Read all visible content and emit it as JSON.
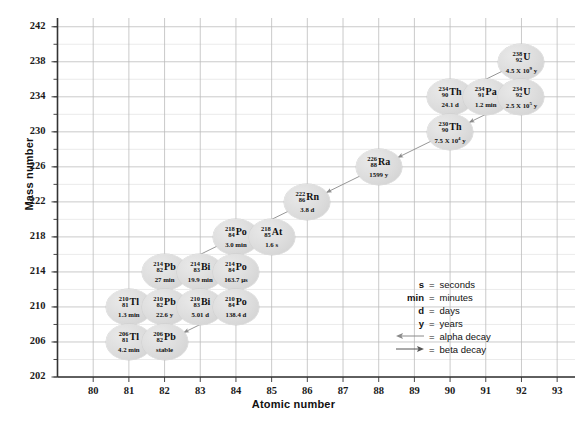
{
  "chart_data": {
    "type": "scatter",
    "title": "",
    "xlabel": "Atomic number",
    "ylabel": "Mass number",
    "xlim": [
      79,
      93.5
    ],
    "ylim": [
      202,
      243
    ],
    "xticks": [
      80,
      81,
      82,
      83,
      84,
      85,
      86,
      87,
      88,
      89,
      90,
      91,
      92,
      93
    ],
    "yticks": [
      202,
      206,
      210,
      214,
      218,
      222,
      226,
      230,
      234,
      238,
      242
    ],
    "grid": true,
    "minor_grid": true,
    "legend_position": "inside-right",
    "nodes": [
      {
        "id": "U238",
        "symbol": "U",
        "mass": "238",
        "atomic": "92",
        "halflife": "4.5 X 10",
        "exponent": "9",
        "unit": "y",
        "x": 92,
        "y": 238
      },
      {
        "id": "Th234",
        "symbol": "Th",
        "mass": "234",
        "atomic": "90",
        "halflife": "24.1 d",
        "exponent": "",
        "unit": "",
        "x": 90,
        "y": 234
      },
      {
        "id": "Pa234",
        "symbol": "Pa",
        "mass": "234",
        "atomic": "91",
        "halflife": "1.2 min",
        "exponent": "",
        "unit": "",
        "x": 91,
        "y": 234
      },
      {
        "id": "U234",
        "symbol": "U",
        "mass": "234",
        "atomic": "92",
        "halflife": "2.5 X 10",
        "exponent": "5",
        "unit": "y",
        "x": 92,
        "y": 234
      },
      {
        "id": "Th230",
        "symbol": "Th",
        "mass": "230",
        "atomic": "90",
        "halflife": "7.5 X 10",
        "exponent": "4",
        "unit": "y",
        "x": 90,
        "y": 230
      },
      {
        "id": "Ra226",
        "symbol": "Ra",
        "mass": "226",
        "atomic": "88",
        "halflife": "1599 y",
        "exponent": "",
        "unit": "",
        "x": 88,
        "y": 226
      },
      {
        "id": "Rn222",
        "symbol": "Rn",
        "mass": "222",
        "atomic": "86",
        "halflife": "3.8 d",
        "exponent": "",
        "unit": "",
        "x": 86,
        "y": 222
      },
      {
        "id": "Po218",
        "symbol": "Po",
        "mass": "218",
        "atomic": "84",
        "halflife": "3.0 min",
        "exponent": "",
        "unit": "",
        "x": 84,
        "y": 218
      },
      {
        "id": "At218",
        "symbol": "At",
        "mass": "218",
        "atomic": "85",
        "halflife": "1.6 s",
        "exponent": "",
        "unit": "",
        "x": 85,
        "y": 218
      },
      {
        "id": "Pb214",
        "symbol": "Pb",
        "mass": "214",
        "atomic": "82",
        "halflife": "27 min",
        "exponent": "",
        "unit": "",
        "x": 82,
        "y": 214
      },
      {
        "id": "Bi214",
        "symbol": "Bi",
        "mass": "214",
        "atomic": "83",
        "halflife": "19.9 min",
        "exponent": "",
        "unit": "",
        "x": 83,
        "y": 214
      },
      {
        "id": "Po214",
        "symbol": "Po",
        "mass": "214",
        "atomic": "84",
        "halflife": "163.7 µs",
        "exponent": "",
        "unit": "",
        "x": 84,
        "y": 214
      },
      {
        "id": "Tl210",
        "symbol": "Tl",
        "mass": "210",
        "atomic": "81",
        "halflife": "1.3 min",
        "exponent": "",
        "unit": "",
        "x": 81,
        "y": 210
      },
      {
        "id": "Pb210",
        "symbol": "Pb",
        "mass": "210",
        "atomic": "82",
        "halflife": "22.6 y",
        "exponent": "",
        "unit": "",
        "x": 82,
        "y": 210
      },
      {
        "id": "Bi210",
        "symbol": "Bi",
        "mass": "210",
        "atomic": "83",
        "halflife": "5.01 d",
        "exponent": "",
        "unit": "",
        "x": 83,
        "y": 210
      },
      {
        "id": "Po210",
        "symbol": "Po",
        "mass": "210",
        "atomic": "84",
        "halflife": "138.4 d",
        "exponent": "",
        "unit": "",
        "x": 84,
        "y": 210
      },
      {
        "id": "Tl206",
        "symbol": "Tl",
        "mass": "206",
        "atomic": "81",
        "halflife": "4.2 min",
        "exponent": "",
        "unit": "",
        "x": 81,
        "y": 206
      },
      {
        "id": "Pb206",
        "symbol": "Pb",
        "mass": "206",
        "atomic": "82",
        "halflife": "stable",
        "exponent": "",
        "unit": "",
        "x": 82,
        "y": 206
      }
    ],
    "decays": [
      {
        "from": "U238",
        "to": "Th234",
        "type": "alpha"
      },
      {
        "from": "Th234",
        "to": "Pa234",
        "type": "beta"
      },
      {
        "from": "Pa234",
        "to": "U234",
        "type": "beta"
      },
      {
        "from": "U234",
        "to": "Th230",
        "type": "alpha"
      },
      {
        "from": "Th230",
        "to": "Ra226",
        "type": "alpha"
      },
      {
        "from": "Ra226",
        "to": "Rn222",
        "type": "alpha"
      },
      {
        "from": "Rn222",
        "to": "Po218",
        "type": "alpha"
      },
      {
        "from": "Po218",
        "to": "At218",
        "type": "beta"
      },
      {
        "from": "Po218",
        "to": "Pb214",
        "type": "alpha"
      },
      {
        "from": "At218",
        "to": "Bi214",
        "type": "alpha"
      },
      {
        "from": "Pb214",
        "to": "Bi214",
        "type": "beta"
      },
      {
        "from": "Bi214",
        "to": "Po214",
        "type": "beta"
      },
      {
        "from": "Bi214",
        "to": "Tl210",
        "type": "alpha"
      },
      {
        "from": "Po214",
        "to": "Pb210",
        "type": "alpha"
      },
      {
        "from": "Tl210",
        "to": "Pb210",
        "type": "beta"
      },
      {
        "from": "Pb210",
        "to": "Bi210",
        "type": "beta"
      },
      {
        "from": "Bi210",
        "to": "Po210",
        "type": "beta"
      },
      {
        "from": "Bi210",
        "to": "Tl206",
        "type": "alpha"
      },
      {
        "from": "Po210",
        "to": "Pb206",
        "type": "alpha"
      },
      {
        "from": "Tl206",
        "to": "Pb206",
        "type": "beta"
      }
    ]
  },
  "legend": {
    "rows": [
      {
        "key": "s",
        "eq": "=",
        "value": "seconds",
        "icon": ""
      },
      {
        "key": "min",
        "eq": "=",
        "value": "minutes",
        "icon": ""
      },
      {
        "key": "d",
        "eq": "=",
        "value": "days",
        "icon": ""
      },
      {
        "key": "y",
        "eq": "=",
        "value": "years",
        "icon": ""
      },
      {
        "key": "",
        "eq": "=",
        "value": "alpha decay",
        "icon": "arrow-left-icon"
      },
      {
        "key": "",
        "eq": "=",
        "value": "beta decay",
        "icon": "arrow-right-icon"
      }
    ]
  },
  "colors": {
    "node_fill": "#dcdcdc",
    "grid_major": "#b9b9b9",
    "grid_minor": "#dddddd",
    "axis": "#333333",
    "arrow": "#8a8a8a",
    "text": "#111111"
  }
}
